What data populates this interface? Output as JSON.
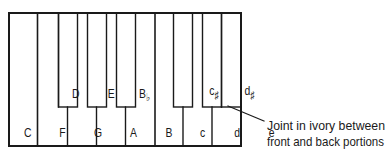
{
  "diagram": {
    "type": "keyboard-schematic",
    "white_keys": [
      {
        "label": "C",
        "x": 26
      },
      {
        "label": "F",
        "x": 54
      },
      {
        "label": "G",
        "x": 83
      },
      {
        "label": "A",
        "x": 112
      },
      {
        "label": "B",
        "x": 141
      },
      {
        "label": "c",
        "x": 169
      },
      {
        "label": "d",
        "x": 198
      },
      {
        "label": "e",
        "x": 227
      }
    ],
    "black_keys": [
      {
        "label": "D",
        "accidental": "",
        "x": 58
      },
      {
        "label": "E",
        "accidental": "",
        "x": 87
      },
      {
        "label": "B",
        "accidental": "♭",
        "x": 116
      },
      {
        "label": "c",
        "accidental": "♯",
        "x": 173
      },
      {
        "label": "d",
        "accidental": "♯",
        "x": 202
      }
    ],
    "annotation": {
      "line1": "Joint in ivory between",
      "line2": "front and back portions"
    },
    "colors": {
      "stroke": "#1a1a1a",
      "background": "#ffffff"
    }
  }
}
